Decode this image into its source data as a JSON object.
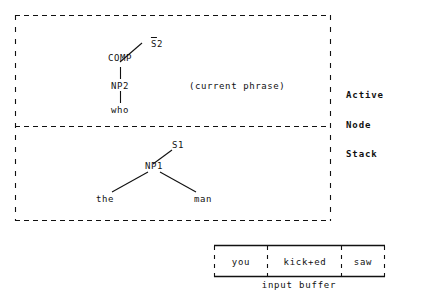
{
  "diagram": {
    "kind": "parser-state-diagram",
    "ink_color": "#111111",
    "background_color": "#ffffff",
    "stack_panel": {
      "side_labels": [
        "Active",
        "Node",
        "Stack"
      ],
      "annotation": "(current phrase)",
      "cells": [
        {
          "id": "active-node-cell",
          "tree": {
            "nodes": [
              {
                "id": "sbar2",
                "label": "S2",
                "overbar_on": "S"
              },
              {
                "id": "comp",
                "label": "COMP"
              },
              {
                "id": "np2",
                "label": "NP2"
              },
              {
                "id": "who",
                "label": "who"
              }
            ],
            "edges": [
              {
                "from": "comp",
                "to": "sbar2"
              },
              {
                "from": "comp",
                "to": "np2"
              },
              {
                "from": "np2",
                "to": "who"
              }
            ]
          }
        },
        {
          "id": "stacked-node-cell",
          "tree": {
            "nodes": [
              {
                "id": "s1",
                "label": "S1"
              },
              {
                "id": "np1",
                "label": "NP1"
              },
              {
                "id": "the",
                "label": "the"
              },
              {
                "id": "man",
                "label": "man"
              }
            ],
            "edges": [
              {
                "from": "np1",
                "to": "s1"
              },
              {
                "from": "np1",
                "to": "the"
              },
              {
                "from": "np1",
                "to": "man"
              }
            ]
          }
        }
      ]
    },
    "input_buffer": {
      "caption": "input buffer",
      "cells": [
        "you",
        "kick+ed",
        "saw"
      ]
    }
  }
}
